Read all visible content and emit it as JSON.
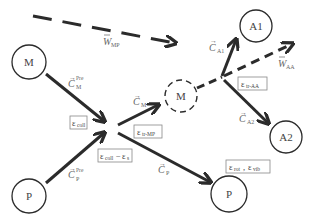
{
  "diagram": {
    "nodes": {
      "M_left": {
        "label": "M",
        "style": "solid"
      },
      "P_left": {
        "label": "P",
        "style": "solid"
      },
      "M_mid": {
        "label": "M",
        "style": "dashed"
      },
      "A1": {
        "label": "A1",
        "style": "solid"
      },
      "A2": {
        "label": "A2",
        "style": "solid"
      },
      "P_right": {
        "label": "P",
        "style": "solid"
      }
    },
    "arrows": {
      "W_MP": {
        "main": "W",
        "sub": "MP",
        "accent": "bar",
        "style": "dashed"
      },
      "C_M_pre": {
        "main": "C",
        "sub": "M",
        "sup": "Pre",
        "accent": "arrow"
      },
      "C_P_pre": {
        "main": "C",
        "sub": "P",
        "sup": "Pre",
        "accent": "arrow"
      },
      "C_M": {
        "main": "C",
        "sub": "M",
        "accent": "arrow"
      },
      "C_P": {
        "main": "C",
        "sub": "P",
        "accent": "arrow"
      },
      "C_A1": {
        "main": "C",
        "sub": "A1",
        "accent": "arrow"
      },
      "C_A2": {
        "main": "C",
        "sub": "A2",
        "accent": "arrow"
      },
      "W_AA": {
        "main": "W",
        "sub": "AA",
        "accent": "bar",
        "style": "dashed"
      }
    },
    "boxes": {
      "coll": {
        "main": "ε",
        "sub": "coll"
      },
      "coll_minus_s": {
        "parts": [
          {
            "main": "ε",
            "sub": "coll"
          },
          {
            "op": "−"
          },
          {
            "main": "ε",
            "sub": "s"
          }
        ]
      },
      "tr_MP": {
        "main": "ε",
        "sub": "tr-MP"
      },
      "tr_AA": {
        "main": "ε",
        "sub": "tr-AA"
      },
      "rot_vib": {
        "parts": [
          {
            "main": "ε",
            "sub": "rot"
          },
          {
            "op": ", "
          },
          {
            "main": "ε",
            "sub": "vib"
          }
        ]
      }
    },
    "colors": {
      "stroke": "#2b2b2b",
      "label": "#555555",
      "box_border": "#888888"
    }
  }
}
